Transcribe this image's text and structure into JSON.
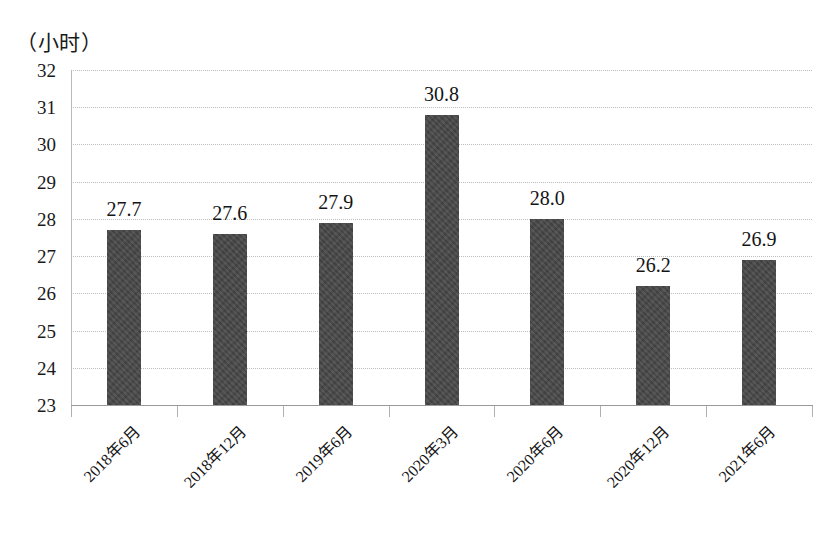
{
  "chart_data": {
    "type": "bar",
    "title": "",
    "subtitle": "",
    "xlabel": "",
    "ylabel": "（小时）",
    "ylim": [
      23,
      32
    ],
    "ytick_step": 1,
    "yticks": [
      "32",
      "31",
      "30",
      "29",
      "28",
      "27",
      "26",
      "25",
      "24",
      "23"
    ],
    "grid": "horizontal-dotted",
    "legend": "none",
    "categories": [
      "2018年6月",
      "2018年12月",
      "2019年6月",
      "2020年3月",
      "2020年6月",
      "2020年12月",
      "2021年6月"
    ],
    "values": [
      27.7,
      27.6,
      27.9,
      30.8,
      28.0,
      26.2,
      26.9
    ],
    "value_labels": [
      "27.7",
      "27.6",
      "27.9",
      "30.8",
      "28.0",
      "26.2",
      "26.9"
    ],
    "series": [
      {
        "name": "",
        "values": [
          27.7,
          27.6,
          27.9,
          30.8,
          28.0,
          26.2,
          26.9
        ]
      }
    ],
    "colors": {
      "bar": "#474747",
      "gridline": "#bdbdbd",
      "axis": "#9a9a9a",
      "text": "#141414",
      "background": "#ffffff"
    }
  }
}
